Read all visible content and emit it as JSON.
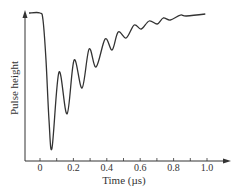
{
  "chart_data": {
    "type": "line",
    "title": "",
    "xlabel": "Time (µs)",
    "ylabel": "Pulse height",
    "xlim": [
      -0.07,
      1.14
    ],
    "ylim": [
      0,
      1
    ],
    "x_ticks": [
      0,
      0.2,
      0.4,
      0.6,
      0.8,
      1.0
    ],
    "x_tick_labels": [
      "0",
      "0.2",
      "0.4",
      "0.6",
      "0.8",
      "1.0"
    ],
    "x_minor_ticks": [
      0.1,
      0.3,
      0.5,
      0.7,
      0.9
    ],
    "y_ticks": [],
    "grid": false,
    "legend": null,
    "series": [
      {
        "name": "Pulse height",
        "color": "#333333",
        "x": [
          -0.066,
          0.0,
          0.018,
          0.036,
          0.054,
          0.072,
          0.114,
          0.162,
          0.204,
          0.252,
          0.294,
          0.336,
          0.39,
          0.432,
          0.468,
          0.516,
          0.564,
          0.606,
          0.654,
          0.702,
          0.738,
          0.78,
          0.84,
          0.876,
          0.99
        ],
        "y": [
          1.0,
          1.0,
          0.953,
          0.682,
          0.277,
          0.088,
          0.601,
          0.318,
          0.682,
          0.493,
          0.757,
          0.635,
          0.824,
          0.75,
          0.872,
          0.831,
          0.919,
          0.892,
          0.946,
          0.926,
          0.966,
          0.953,
          0.986,
          0.98,
          0.993
        ]
      }
    ]
  },
  "layout": {
    "axis_color": "#333333",
    "line_color": "#333333"
  }
}
